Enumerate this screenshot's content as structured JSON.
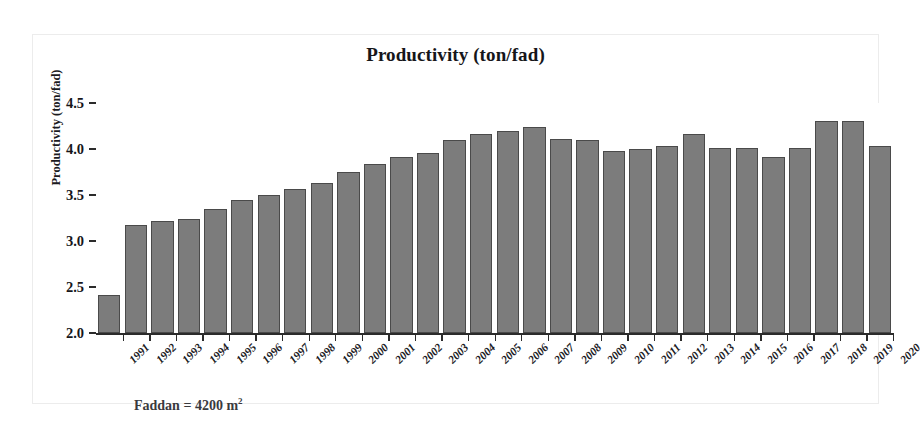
{
  "chart_data": {
    "type": "bar",
    "title": "Productivity (ton/fad)",
    "xlabel": "",
    "ylabel": "Productivity (ton/fad)",
    "ylim": [
      2.0,
      4.5
    ],
    "yticks": [
      "4.5",
      "4.0",
      "3.5",
      "3.0",
      "2.5",
      "2.0"
    ],
    "ytick_values": [
      4.5,
      4.0,
      3.5,
      3.0,
      2.5,
      2.0
    ],
    "grid": false,
    "legend": "none",
    "bar_color": "#7c7c7c",
    "bar_edge_color": "#4a4a4a",
    "categories": [
      "1991",
      "1992",
      "1993",
      "1994",
      "1995",
      "1996",
      "1997",
      "1998",
      "1999",
      "2000",
      "2001",
      "2002",
      "2003",
      "2004",
      "2005",
      "2006",
      "2007",
      "2008",
      "2009",
      "2010",
      "2011",
      "2012",
      "2013",
      "2014",
      "2015",
      "2016",
      "2017",
      "2018",
      "2019",
      "2020"
    ],
    "values": [
      2.41,
      3.17,
      3.22,
      3.24,
      3.35,
      3.45,
      3.5,
      3.56,
      3.63,
      3.75,
      3.84,
      3.91,
      3.96,
      4.1,
      4.16,
      4.2,
      4.24,
      4.11,
      4.1,
      3.98,
      4.0,
      4.03,
      4.16,
      4.01,
      4.01,
      3.91,
      4.01,
      4.3,
      4.3,
      4.03
    ],
    "annotations": [
      "Faddan = 4200 m2"
    ]
  },
  "footnote": {
    "text_before": "Faddan = 4200 m",
    "superscript": "2"
  }
}
